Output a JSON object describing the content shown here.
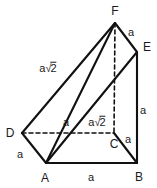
{
  "figure": {
    "background_color": "#ffffff",
    "stroke_color": "#111111",
    "label_color": "#1a1a1a",
    "width": 157,
    "height": 188
  },
  "vertices": [
    {
      "name": "F",
      "label": "F",
      "x": 115,
      "y": 23,
      "label_x": 115,
      "label_y": 11
    },
    {
      "name": "E",
      "label": "E",
      "x": 137,
      "y": 52,
      "label_x": 147,
      "label_y": 47
    },
    {
      "name": "D",
      "label": "D",
      "x": 22,
      "y": 133,
      "label_x": 10,
      "label_y": 133
    },
    {
      "name": "C",
      "label": "C",
      "x": 114,
      "y": 133,
      "label_x": 114,
      "label_y": 144
    },
    {
      "name": "A",
      "label": "A",
      "x": 46,
      "y": 163,
      "label_x": 45,
      "label_y": 178
    },
    {
      "name": "B",
      "label": "B",
      "x": 137,
      "y": 163,
      "label_x": 139,
      "label_y": 177
    }
  ],
  "edges": [
    {
      "name": "edge-D-F",
      "from": "D",
      "to": "F",
      "style": "solid"
    },
    {
      "name": "edge-F-E",
      "from": "F",
      "to": "E",
      "style": "solid"
    },
    {
      "name": "edge-E-B",
      "from": "E",
      "to": "B",
      "style": "solid"
    },
    {
      "name": "edge-A-B",
      "from": "A",
      "to": "B",
      "style": "solid"
    },
    {
      "name": "edge-D-A",
      "from": "D",
      "to": "A",
      "style": "solid"
    },
    {
      "name": "edge-A-F",
      "from": "A",
      "to": "F",
      "style": "solid"
    },
    {
      "name": "edge-A-E",
      "from": "A",
      "to": "E",
      "style": "solid"
    },
    {
      "name": "edge-C-B",
      "from": "C",
      "to": "B",
      "style": "solid"
    },
    {
      "name": "edge-F-C",
      "from": "F",
      "to": "C",
      "style": "dashed"
    },
    {
      "name": "edge-D-C",
      "from": "D",
      "to": "C",
      "style": "dashed"
    }
  ],
  "edge_labels": [
    {
      "name": "length-label-DF",
      "text": "a√2",
      "has_radical": true,
      "base": "a",
      "radicand": "2",
      "x": 48,
      "y": 68,
      "edge": "edge-D-F"
    },
    {
      "name": "length-label-FE",
      "text": "a",
      "has_radical": false,
      "base": "a",
      "radicand": "",
      "x": 131,
      "y": 32,
      "edge": "edge-F-E"
    },
    {
      "name": "length-label-EB",
      "text": "a",
      "has_radical": false,
      "base": "a",
      "radicand": "",
      "x": 143,
      "y": 110,
      "edge": "edge-E-B"
    },
    {
      "name": "length-label-CB",
      "text": "a",
      "has_radical": false,
      "base": "a",
      "radicand": "",
      "x": 128,
      "y": 139,
      "edge": "edge-C-B"
    },
    {
      "name": "length-label-AB",
      "text": "a",
      "has_radical": false,
      "base": "a",
      "radicand": "",
      "x": 91,
      "y": 177,
      "edge": "edge-A-B"
    },
    {
      "name": "length-label-DA",
      "text": "a",
      "has_radical": false,
      "base": "a",
      "radicand": "",
      "x": 20,
      "y": 154,
      "edge": "edge-D-A"
    },
    {
      "name": "length-label-DC",
      "text": "a",
      "has_radical": false,
      "base": "a",
      "radicand": "",
      "x": 66,
      "y": 122,
      "edge": "edge-D-C"
    },
    {
      "name": "length-label-AF",
      "text": "a√2",
      "has_radical": true,
      "base": "a",
      "radicand": "2",
      "x": 97,
      "y": 122,
      "edge": "edge-A-F"
    }
  ]
}
